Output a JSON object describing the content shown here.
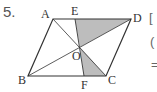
{
  "problem": {
    "number": "5."
  },
  "figure": {
    "shape": "parallelogram",
    "points": {
      "A": {
        "label": "A",
        "x": 53,
        "y": 19
      },
      "E": {
        "label": "E",
        "x": 75,
        "y": 19
      },
      "D": {
        "label": "D",
        "x": 131,
        "y": 19
      },
      "B": {
        "label": "B",
        "x": 28,
        "y": 76
      },
      "F": {
        "label": "F",
        "x": 84,
        "y": 76
      },
      "C": {
        "label": "C",
        "x": 106,
        "y": 76
      },
      "O": {
        "label": "O",
        "x": 80,
        "y": 47
      }
    },
    "shaded_regions": [
      "triangle E-O-D",
      "triangle O-F-C"
    ],
    "shade_color": "#bdbdbd",
    "line_color": "#333333"
  },
  "right_edge_text": {
    "line1": "[",
    "line2": "(",
    "line3": "="
  }
}
